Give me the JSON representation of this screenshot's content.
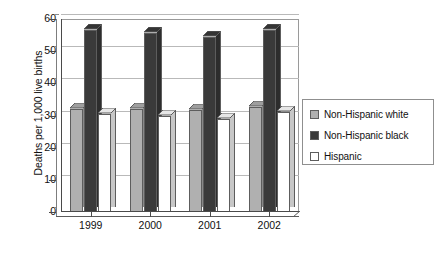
{
  "chart_data": {
    "type": "bar",
    "title": "",
    "subtitle": "",
    "xlabel": "",
    "ylabel": "Deaths per 1,000 live births",
    "categories": [
      "1999",
      "2000",
      "2001",
      "2002"
    ],
    "series": [
      {
        "name": "Non-Hispanic white",
        "values": [
          32,
          32,
          31.8,
          32.5
        ],
        "color": "#b0b0b0"
      },
      {
        "name": "Non-Hispanic black",
        "values": [
          56.5,
          55.5,
          54.5,
          56.5
        ],
        "color": "#3a3a3a"
      },
      {
        "name": "Hispanic",
        "values": [
          30.5,
          30,
          29,
          31
        ],
        "color": "#ffffff"
      }
    ],
    "ylim": [
      0,
      60
    ],
    "yticks": [
      0,
      10,
      20,
      30,
      40,
      50,
      60
    ],
    "ytick_labels": [
      "0",
      "10",
      "20",
      "30",
      "40",
      "50",
      "60"
    ],
    "grid": true,
    "grid_axis": "y",
    "legend_position": "right",
    "style": "3d-column",
    "background": "#ffffff",
    "axis_color": "#4a4a4a",
    "grid_color": "#b9b9b9"
  },
  "legend": {
    "items": [
      {
        "label": "Non-Hispanic white",
        "color": "#b0b0b0"
      },
      {
        "label": "Non-Hispanic black",
        "color": "#3a3a3a"
      },
      {
        "label": "Hispanic",
        "color": "#ffffff"
      }
    ]
  }
}
